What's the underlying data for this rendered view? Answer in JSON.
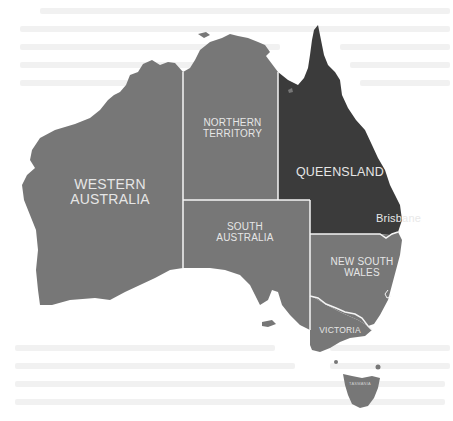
{
  "map": {
    "title": "Australia states and territories",
    "colors": {
      "land": "#777777",
      "highlight": "#3b3b3b",
      "border": "#f4f4f4",
      "background": "#ffffff",
      "label": "#e6e6e6"
    },
    "regions": [
      {
        "id": "wa",
        "name_line1": "WESTERN",
        "name_line2": "AUSTRALIA",
        "highlighted": false
      },
      {
        "id": "nt",
        "name_line1": "NORTHERN",
        "name_line2": "TERRITORY",
        "highlighted": false
      },
      {
        "id": "qld",
        "name_line1": "QUEENSLAND",
        "name_line2": "",
        "highlighted": true
      },
      {
        "id": "sa",
        "name_line1": "SOUTH",
        "name_line2": "AUSTRALIA",
        "highlighted": false
      },
      {
        "id": "nsw",
        "name_line1": "NEW SOUTH",
        "name_line2": "WALES",
        "highlighted": false
      },
      {
        "id": "vic",
        "name_line1": "VICTORIA",
        "name_line2": "",
        "highlighted": false
      },
      {
        "id": "tas",
        "name_line1": "TASMANIA",
        "name_line2": "",
        "highlighted": false
      }
    ],
    "cities": [
      {
        "name": "Brisbane",
        "marker": "star-icon"
      }
    ]
  }
}
